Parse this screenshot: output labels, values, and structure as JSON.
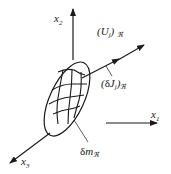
{
  "diagram": {
    "axes": {
      "x1": {
        "label": "x",
        "sub": "1"
      },
      "x2": {
        "label": "x",
        "sub": "2"
      },
      "x3": {
        "label": "x",
        "sub": "3"
      }
    },
    "labels": {
      "velocity": {
        "open": "(",
        "symbol": "U",
        "sub": "j",
        "close": ")",
        "frame": "ℜ"
      },
      "momentum_flux": {
        "open": "(",
        "delta": "δ",
        "symbol": "J",
        "sub": "j",
        "close": ")",
        "frame": "ℜ"
      },
      "mass_element": {
        "delta": "δ",
        "symbol": "m",
        "frame": "ℜ"
      }
    },
    "colors": {
      "stroke": "#1a1a1a",
      "background": "#ffffff"
    }
  }
}
